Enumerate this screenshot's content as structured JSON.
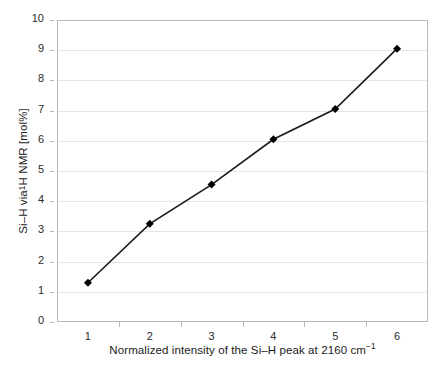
{
  "chart_data": {
    "type": "line",
    "title": "",
    "xlabel": "Normalized intensity of the Si–H peak at 2160 cm⁻¹",
    "ylabel": "Si–H via ¹H NMR [mol%]",
    "categories": [
      1,
      2,
      3,
      4,
      5,
      6
    ],
    "x": [
      1,
      2,
      3,
      4,
      5,
      6
    ],
    "values": [
      1.3,
      3.25,
      4.55,
      6.05,
      7.05,
      9.05
    ],
    "series": [
      {
        "name": "Si–H via 1H NMR",
        "values": [
          1.3,
          3.25,
          4.55,
          6.05,
          7.05,
          9.05
        ]
      }
    ],
    "ylim": [
      0,
      10
    ],
    "ytick_values": [
      0,
      1,
      2,
      3,
      4,
      5,
      6,
      7,
      8,
      9,
      10
    ],
    "xtick_labels": [
      "1",
      "2",
      "3",
      "4",
      "5",
      "6"
    ],
    "grid": "horizontal",
    "legend": "none",
    "marker": "diamond",
    "marker_color": "#000000",
    "line_color": "#1a1a1a",
    "gridline_color": "#e6e6e6",
    "frame_color": "#b9b9b9",
    "background_color": "#ffffff"
  },
  "axis_titles": {
    "x_prefix": "Normalized intensity of the Si–H peak at 2160 cm",
    "x_superscript": "−1",
    "y_part1": "Si–H via ",
    "y_superscript": "1",
    "y_part2": "H NMR [mol%]"
  }
}
